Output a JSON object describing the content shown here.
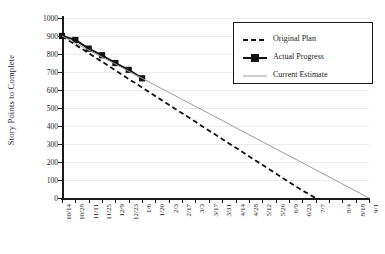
{
  "chart_data": {
    "type": "line",
    "title": "",
    "xlabel": "",
    "ylabel": "Story Points to Complete",
    "ylim": [
      0,
      1000
    ],
    "ytick_step": 100,
    "yticks": [
      0,
      100,
      200,
      300,
      400,
      500,
      600,
      700,
      800,
      900,
      1000
    ],
    "grid": true,
    "grid_axis": "y",
    "legend_position": "top-right",
    "x": [
      "10/14",
      "10/28",
      "11/11",
      "11/25",
      "12/9",
      "12/23",
      "1/6",
      "1/20",
      "2/3",
      "2/17",
      "3/3",
      "3/17",
      "3/31",
      "4/14",
      "4/28",
      "5/12",
      "5/26",
      "6/9",
      "6/23",
      "7/7",
      "",
      "8/4",
      "8/18",
      "9/1"
    ],
    "xtick_labels": [
      "10/14",
      "10/28",
      "11/11",
      "11/25",
      "12/9",
      "12/23",
      "1/6",
      "1/20",
      "2/3",
      "2/17",
      "3/3",
      "3/17",
      "3/31",
      "4/14",
      "4/28",
      "5/12",
      "5/26",
      "6/9",
      "6/23",
      "7/7",
      "",
      "8/4",
      "8/18",
      "9/1"
    ],
    "series": [
      {
        "name": "Original Plan",
        "style": "dashed",
        "color": "#111111",
        "marker": "none",
        "values": [
          900,
          852,
          804,
          757,
          709,
          661,
          614,
          566,
          518,
          471,
          423,
          375,
          328,
          280,
          232,
          185,
          137,
          89,
          42,
          0,
          null,
          null,
          null,
          null
        ]
      },
      {
        "name": "Actual Progress",
        "style": "solid",
        "color": "#111111",
        "marker": "square",
        "values": [
          900,
          878,
          830,
          793,
          750,
          712,
          665,
          null,
          null,
          null,
          null,
          null,
          null,
          null,
          null,
          null,
          null,
          null,
          null,
          null,
          null,
          null,
          null,
          null
        ]
      },
      {
        "name": "Current Estimate",
        "style": "solid-thin",
        "color": "#9a9a9a",
        "marker": "none",
        "values": [
          900,
          861,
          822,
          783,
          744,
          704,
          665,
          626,
          587,
          548,
          509,
          470,
          431,
          391,
          352,
          313,
          274,
          235,
          196,
          157,
          118,
          78,
          39,
          0
        ]
      }
    ]
  },
  "legend": {
    "items": [
      {
        "label": "Original Plan",
        "key": "dashed-line-key"
      },
      {
        "label": "Actual Progress",
        "key": "solid-square-line-key"
      },
      {
        "label": "Current Estimate",
        "key": "thin-gray-line-key"
      }
    ]
  },
  "colors": {
    "plan": "#111111",
    "actual": "#111111",
    "estimate": "#9a9a9a",
    "grid": "#ececec",
    "axis": "#1a1a1a",
    "background": "#ffffff"
  }
}
